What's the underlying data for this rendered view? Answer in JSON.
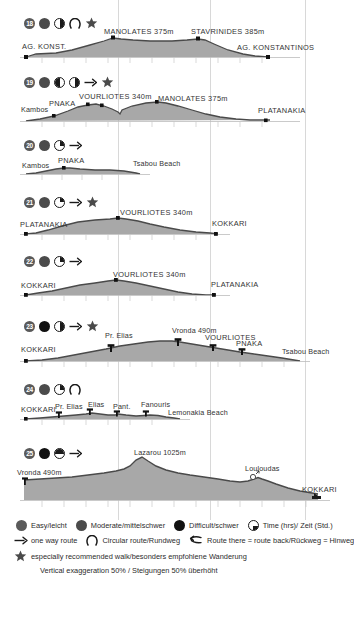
{
  "gridlines_x": [
    118,
    210,
    305
  ],
  "colors": {
    "fill": "#a8a8a8",
    "line": "#4a4a4a",
    "grid": "#d8d8d8",
    "text": "#2b2b2b",
    "easy": "#5a5a5a",
    "moderate": "#4b4b4b",
    "difficult": "#111111"
  },
  "profiles": [
    {
      "number": "18",
      "icons": [
        "badge",
        "dot-moderate",
        "clock-half",
        "loop",
        "star"
      ],
      "labels": [
        {
          "text": "AG. KONST.",
          "x": 22,
          "y": 32,
          "caps": true
        },
        {
          "text": "MANOLATES 375m",
          "x": 104,
          "y": 26,
          "caps": true
        },
        {
          "text": "STAVRINIDES 385m",
          "x": 194,
          "y": 24,
          "caps": true
        },
        {
          "text": "AG. KONSTANTINOS",
          "x": 240,
          "y": 34,
          "caps": true
        }
      ]
    },
    {
      "number": "19",
      "icons": [
        "badge",
        "dot-moderate",
        "clock-q3",
        "clock-half",
        "arrow",
        "star"
      ],
      "labels": [
        {
          "text": "Kambos",
          "x": 22,
          "y": 32,
          "caps": false
        },
        {
          "text": "PNAKA",
          "x": 50,
          "y": 28,
          "caps": true
        },
        {
          "text": "VOURLIOTES 340m",
          "x": 84,
          "y": 22,
          "caps": true
        },
        {
          "text": "MANOLATES 375m",
          "x": 161,
          "y": 24,
          "caps": true
        },
        {
          "text": "PLATANAKIA",
          "x": 262,
          "y": 34,
          "caps": true
        }
      ]
    },
    {
      "number": "20",
      "icons": [
        "badge",
        "dot-moderate",
        "clock-q1",
        "arrow"
      ],
      "labels": [
        {
          "text": "Kambos",
          "x": 22,
          "y": 30,
          "caps": false
        },
        {
          "text": "PNAKA",
          "x": 61,
          "y": 25,
          "caps": true
        },
        {
          "text": "Tsabou Beach",
          "x": 135,
          "y": 28,
          "caps": false
        }
      ]
    },
    {
      "number": "21",
      "icons": [
        "badge",
        "dot-moderate",
        "clock-q1",
        "arrow",
        "star"
      ],
      "labels": [
        {
          "text": "PLATANAKIA",
          "x": 22,
          "y": 29,
          "caps": true
        },
        {
          "text": "VOURLIOTES 340m",
          "x": 120,
          "y": 22,
          "caps": true
        },
        {
          "text": "KOKKARI",
          "x": 215,
          "y": 29,
          "caps": true
        }
      ]
    },
    {
      "number": "22",
      "icons": [
        "badge",
        "dot-moderate",
        "clock-q1",
        "arrow"
      ],
      "labels": [
        {
          "text": "KOKKARI",
          "x": 22,
          "y": 30,
          "caps": true
        },
        {
          "text": "VOURLIOTES 340m",
          "x": 113,
          "y": 22,
          "caps": true
        },
        {
          "text": "PLATANAKIA",
          "x": 214,
          "y": 29,
          "caps": true
        }
      ]
    },
    {
      "number": "23",
      "icons": [
        "badge",
        "dot-difficult",
        "clock-half",
        "arrow",
        "star"
      ],
      "labels": [
        {
          "text": "KOKKARI",
          "x": 22,
          "y": 31,
          "caps": true
        },
        {
          "text": "Pr. Elias",
          "x": 108,
          "y": 22,
          "caps": false
        },
        {
          "text": "Vronda 490m",
          "x": 174,
          "y": 18,
          "caps": false
        },
        {
          "text": "VOURLIOTES",
          "x": 206,
          "y": 25,
          "caps": true
        },
        {
          "text": "PNAKA",
          "x": 236,
          "y": 30,
          "caps": true
        },
        {
          "text": "Tsabou Beach",
          "x": 283,
          "y": 35,
          "caps": false
        }
      ]
    },
    {
      "number": "24",
      "icons": [
        "badge",
        "dot-moderate",
        "clock-q1",
        "loop"
      ],
      "labels": [
        {
          "text": "KOKKARI",
          "x": 22,
          "y": 28,
          "caps": true
        },
        {
          "text": "Pr. Elias",
          "x": 57,
          "y": 25,
          "caps": false
        },
        {
          "text": "Elias",
          "x": 90,
          "y": 23,
          "caps": false
        },
        {
          "text": "Pant.",
          "x": 115,
          "y": 25,
          "caps": false
        },
        {
          "text": "Fanouris",
          "x": 145,
          "y": 23,
          "caps": false
        },
        {
          "text": "Lemonakia Beach",
          "x": 170,
          "y": 31,
          "caps": false
        }
      ]
    },
    {
      "number": "25",
      "icons": [
        "badge",
        "dot-difficult",
        "clock-q34",
        "arrow"
      ],
      "labels": [
        {
          "text": "Vronda 490m",
          "x": 18,
          "y": 30,
          "caps": false
        },
        {
          "text": "Lazarou 1025m",
          "x": 136,
          "y": 20,
          "caps": false
        },
        {
          "text": "Louloudas",
          "x": 248,
          "y": 30,
          "caps": false
        },
        {
          "text": "KOKKARI",
          "x": 300,
          "y": 46,
          "caps": true
        }
      ]
    }
  ],
  "legend": {
    "row1": [
      {
        "icon": "dot-easy",
        "text": "Easy/leicht"
      },
      {
        "icon": "dot-moderate",
        "text": "Moderate/mittelschwer"
      },
      {
        "icon": "dot-difficult",
        "text": "Difficult/schwer"
      },
      {
        "icon": "clock",
        "text": "Time (hrs)/ Zeit (Std.)"
      }
    ],
    "row2": [
      {
        "icon": "arrow",
        "text": "one way route"
      },
      {
        "icon": "loop",
        "text": "Circular route/Rundweg"
      },
      {
        "icon": "two-way-arrow",
        "text": "Route there = route back/Rückweg = Hinweg"
      }
    ],
    "row3": [
      {
        "icon": "star",
        "text": "especially recommended walk/besonders empfohlene Wanderung"
      }
    ],
    "note": "Vertical exaggeration 50% / Steigungen 50% überhöht"
  }
}
